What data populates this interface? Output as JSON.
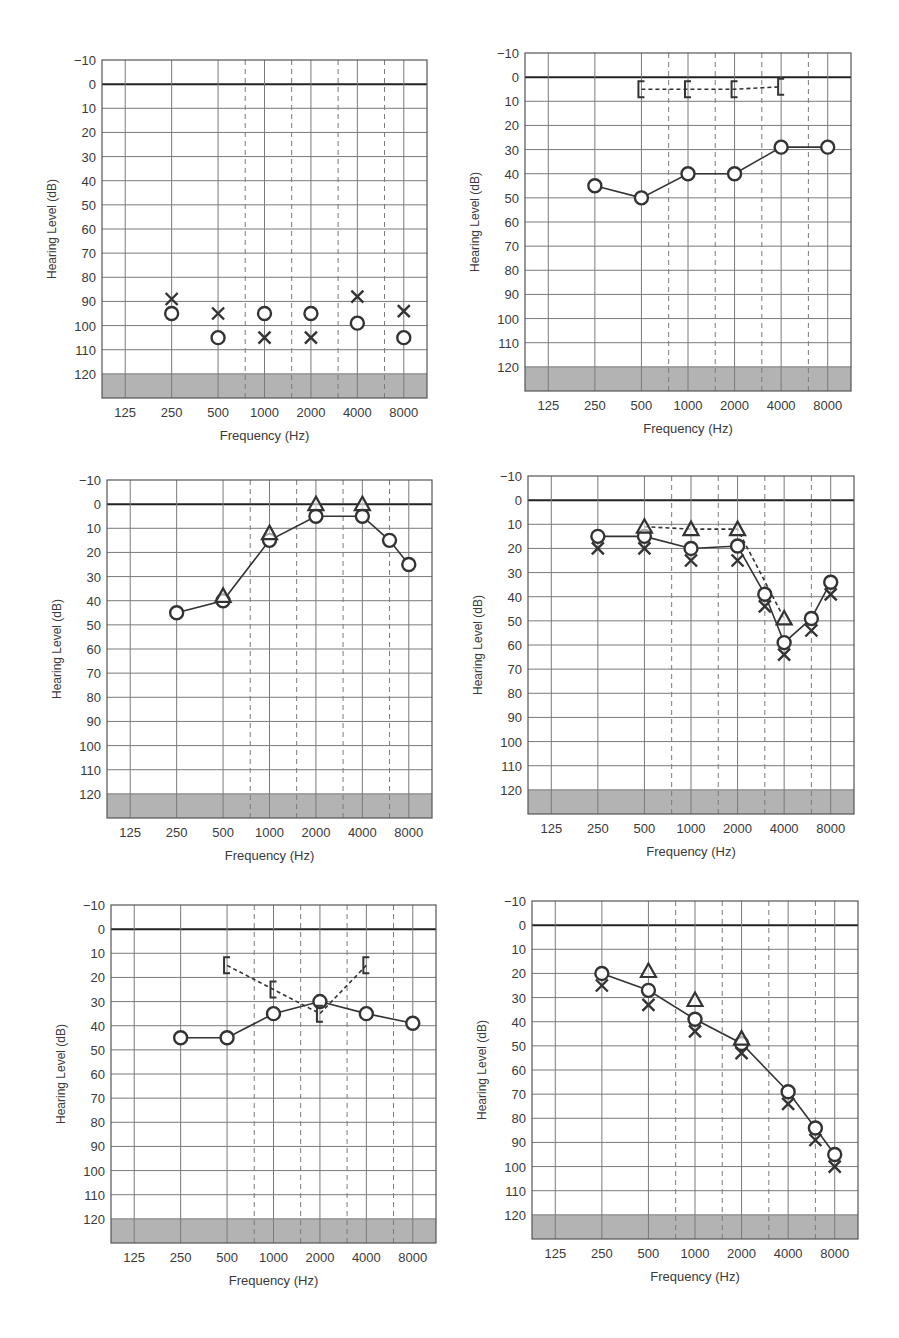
{
  "page": {
    "width": 899,
    "height": 1338,
    "background": "#ffffff"
  },
  "colors": {
    "grid": "#7a7a7a",
    "zero_line": "#222222",
    "mask": "#b3b3b3",
    "marker": "#333333"
  },
  "chart_data": [
    {
      "id": "audiogram-1",
      "type": "scatter",
      "title": "",
      "xlabel": "Frequency (Hz)",
      "ylabel": "Hearing Level (dB)",
      "x_ticks": [
        "125",
        "250",
        "500",
        "1000",
        "2000",
        "4000",
        "8000"
      ],
      "y_ticks": [
        -10,
        0,
        10,
        20,
        30,
        40,
        50,
        60,
        70,
        80,
        90,
        100,
        110,
        120
      ],
      "ylim": [
        -10,
        130
      ],
      "y_inverted": true,
      "grid": true,
      "series": [
        {
          "name": "Right air (O)",
          "marker": "circle",
          "line": "none",
          "points": [
            [
              250,
              95
            ],
            [
              500,
              105
            ],
            [
              1000,
              95
            ],
            [
              2000,
              95
            ],
            [
              4000,
              99
            ],
            [
              8000,
              105
            ]
          ]
        },
        {
          "name": "Left air (X)",
          "marker": "x",
          "line": "none",
          "points": [
            [
              250,
              89
            ],
            [
              500,
              95
            ],
            [
              1000,
              105
            ],
            [
              2000,
              105
            ],
            [
              4000,
              88
            ],
            [
              8000,
              94
            ]
          ]
        }
      ]
    },
    {
      "id": "audiogram-2",
      "type": "line",
      "title": "",
      "xlabel": "Frequency (Hz)",
      "ylabel": "Hearing Level (dB)",
      "x_ticks": [
        "125",
        "250",
        "500",
        "1000",
        "2000",
        "4000",
        "8000"
      ],
      "y_ticks": [
        -10,
        0,
        10,
        20,
        30,
        40,
        50,
        60,
        70,
        80,
        90,
        100,
        110,
        120
      ],
      "ylim": [
        -10,
        130
      ],
      "y_inverted": true,
      "grid": true,
      "series": [
        {
          "name": "Right air (O)",
          "marker": "circle",
          "line": "solid",
          "points": [
            [
              250,
              45
            ],
            [
              500,
              50
            ],
            [
              1000,
              40
            ],
            [
              2000,
              40
            ],
            [
              4000,
              29
            ],
            [
              8000,
              29
            ]
          ]
        },
        {
          "name": "Right bone masked ([)",
          "marker": "bracket",
          "line": "dashed",
          "points": [
            [
              500,
              5
            ],
            [
              1000,
              5
            ],
            [
              2000,
              5
            ],
            [
              4000,
              4
            ]
          ]
        }
      ]
    },
    {
      "id": "audiogram-3",
      "type": "line",
      "title": "",
      "xlabel": "Frequency (Hz)",
      "ylabel": "Hearing Level (dB)",
      "x_ticks": [
        "125",
        "250",
        "500",
        "1000",
        "2000",
        "4000",
        "8000"
      ],
      "y_ticks": [
        -10,
        0,
        10,
        20,
        30,
        40,
        50,
        60,
        70,
        80,
        90,
        100,
        110,
        120
      ],
      "ylim": [
        -10,
        130
      ],
      "y_inverted": true,
      "grid": true,
      "series": [
        {
          "name": "Right air (O)",
          "marker": "circle",
          "line": "solid",
          "points": [
            [
              250,
              45
            ],
            [
              500,
              40
            ],
            [
              1000,
              15
            ],
            [
              2000,
              5
            ],
            [
              4000,
              5
            ],
            [
              6000,
              15
            ],
            [
              8000,
              25
            ]
          ]
        },
        {
          "name": "Bone unmasked (triangle)",
          "marker": "triangle",
          "line": "none",
          "points": [
            [
              500,
              38
            ],
            [
              1000,
              12
            ],
            [
              2000,
              0
            ],
            [
              4000,
              0
            ]
          ]
        }
      ]
    },
    {
      "id": "audiogram-4",
      "type": "line",
      "title": "",
      "xlabel": "Frequency (Hz)",
      "ylabel": "Hearing Level (dB)",
      "x_ticks": [
        "125",
        "250",
        "500",
        "1000",
        "2000",
        "4000",
        "8000"
      ],
      "y_ticks": [
        -10,
        0,
        10,
        20,
        30,
        40,
        50,
        60,
        70,
        80,
        90,
        100,
        110,
        120
      ],
      "ylim": [
        -10,
        130
      ],
      "y_inverted": true,
      "grid": true,
      "series": [
        {
          "name": "Right air (O)",
          "marker": "circle",
          "line": "solid",
          "points": [
            [
              250,
              15
            ],
            [
              500,
              15
            ],
            [
              1000,
              20
            ],
            [
              2000,
              19
            ],
            [
              3000,
              39
            ],
            [
              4000,
              59
            ],
            [
              6000,
              49
            ],
            [
              8000,
              34
            ]
          ]
        },
        {
          "name": "Left air (X)",
          "marker": "x",
          "line": "none",
          "points": [
            [
              250,
              20
            ],
            [
              500,
              20
            ],
            [
              1000,
              25
            ],
            [
              2000,
              25
            ],
            [
              3000,
              44
            ],
            [
              4000,
              64
            ],
            [
              6000,
              54
            ],
            [
              8000,
              39
            ]
          ]
        },
        {
          "name": "Bone unmasked (triangle)",
          "marker": "triangle",
          "line": "dashed",
          "points": [
            [
              500,
              11
            ],
            [
              1000,
              12
            ],
            [
              2000,
              12
            ],
            [
              4000,
              49
            ]
          ]
        }
      ]
    },
    {
      "id": "audiogram-5",
      "type": "line",
      "title": "",
      "xlabel": "Frequency (Hz)",
      "ylabel": "Hearing Level (dB)",
      "x_ticks": [
        "125",
        "250",
        "500",
        "1000",
        "2000",
        "4000",
        "8000"
      ],
      "y_ticks": [
        -10,
        0,
        10,
        20,
        30,
        40,
        50,
        60,
        70,
        80,
        90,
        100,
        110,
        120
      ],
      "ylim": [
        -10,
        130
      ],
      "y_inverted": true,
      "grid": true,
      "series": [
        {
          "name": "Right air (O)",
          "marker": "circle",
          "line": "solid",
          "points": [
            [
              250,
              45
            ],
            [
              500,
              45
            ],
            [
              1000,
              35
            ],
            [
              2000,
              30
            ],
            [
              4000,
              35
            ],
            [
              8000,
              39
            ]
          ]
        },
        {
          "name": "Right bone masked ([)",
          "marker": "bracket",
          "line": "dashed",
          "points": [
            [
              500,
              15
            ],
            [
              1000,
              25
            ],
            [
              2000,
              35
            ],
            [
              4000,
              15
            ]
          ]
        }
      ]
    },
    {
      "id": "audiogram-6",
      "type": "line",
      "title": "",
      "xlabel": "Frequency (Hz)",
      "ylabel": "Hearing Level (dB)",
      "x_ticks": [
        "125",
        "250",
        "500",
        "1000",
        "2000",
        "4000",
        "8000"
      ],
      "y_ticks": [
        -10,
        0,
        10,
        20,
        30,
        40,
        50,
        60,
        70,
        80,
        90,
        100,
        110,
        120
      ],
      "ylim": [
        -10,
        130
      ],
      "y_inverted": true,
      "grid": true,
      "series": [
        {
          "name": "Right air (O)",
          "marker": "circle",
          "line": "solid",
          "points": [
            [
              250,
              20
            ],
            [
              500,
              27
            ],
            [
              1000,
              39
            ],
            [
              2000,
              49
            ],
            [
              4000,
              69
            ],
            [
              6000,
              84
            ],
            [
              8000,
              95
            ]
          ]
        },
        {
          "name": "Left air (X)",
          "marker": "x",
          "line": "none",
          "points": [
            [
              250,
              25
            ],
            [
              500,
              33
            ],
            [
              1000,
              44
            ],
            [
              2000,
              53
            ],
            [
              4000,
              74
            ],
            [
              6000,
              89
            ],
            [
              8000,
              100
            ]
          ]
        },
        {
          "name": "Bone unmasked (triangle)",
          "marker": "triangle",
          "line": "none",
          "points": [
            [
              500,
              19
            ],
            [
              1000,
              31
            ],
            [
              2000,
              47
            ]
          ]
        }
      ]
    }
  ],
  "layout": {
    "panels": [
      {
        "x": 102,
        "y": 60,
        "w": 325,
        "h": 338
      },
      {
        "x": 525,
        "y": 53,
        "w": 326,
        "h": 338
      },
      {
        "x": 107,
        "y": 480,
        "w": 325,
        "h": 338
      },
      {
        "x": 528,
        "y": 476,
        "w": 326,
        "h": 338
      },
      {
        "x": 111,
        "y": 905,
        "w": 325,
        "h": 338
      },
      {
        "x": 532,
        "y": 901,
        "w": 326,
        "h": 338
      }
    ]
  }
}
